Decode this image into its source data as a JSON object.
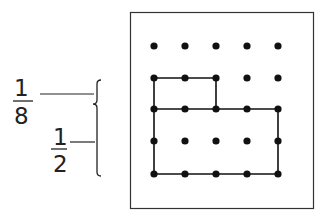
{
  "labels": {
    "fraction_top": {
      "numerator": "1",
      "denominator": "8"
    },
    "fraction_bottom": {
      "numerator": "1",
      "denominator": "2"
    }
  },
  "grid": {
    "rows": 5,
    "cols": 5,
    "x": [
      154,
      185,
      216,
      247,
      278
    ],
    "y": [
      46,
      78,
      109,
      141,
      174
    ]
  },
  "colors": {
    "ink": "#111111",
    "frame": "#333333"
  }
}
